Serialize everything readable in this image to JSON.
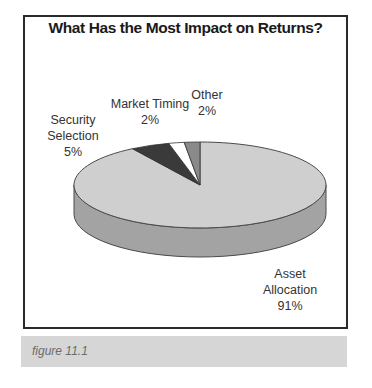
{
  "figure": {
    "caption": "figure 11.1"
  },
  "chart_data": {
    "type": "pie",
    "style": "3d",
    "title": "What Has the Most Impact on Returns?",
    "categories": [
      "Asset Allocation",
      "Security Selection",
      "Market Timing",
      "Other"
    ],
    "values": [
      91,
      5,
      2,
      2
    ],
    "unit": "%",
    "labels": [
      {
        "lines": [
          "Asset",
          "Allocation",
          "91%"
        ]
      },
      {
        "lines": [
          "Security",
          "Selection",
          "5%"
        ]
      },
      {
        "lines": [
          "Market Timing",
          "2%"
        ]
      },
      {
        "lines": [
          "Other",
          "2%"
        ]
      }
    ],
    "colors": {
      "Asset Allocation": "#cfcfcf",
      "Asset Allocation side": "#a3a3a3",
      "Security Selection": "#3a3a3a",
      "Market Timing": "#ffffff",
      "Other": "#8a8a8a"
    },
    "legend": "none (data labels)"
  }
}
